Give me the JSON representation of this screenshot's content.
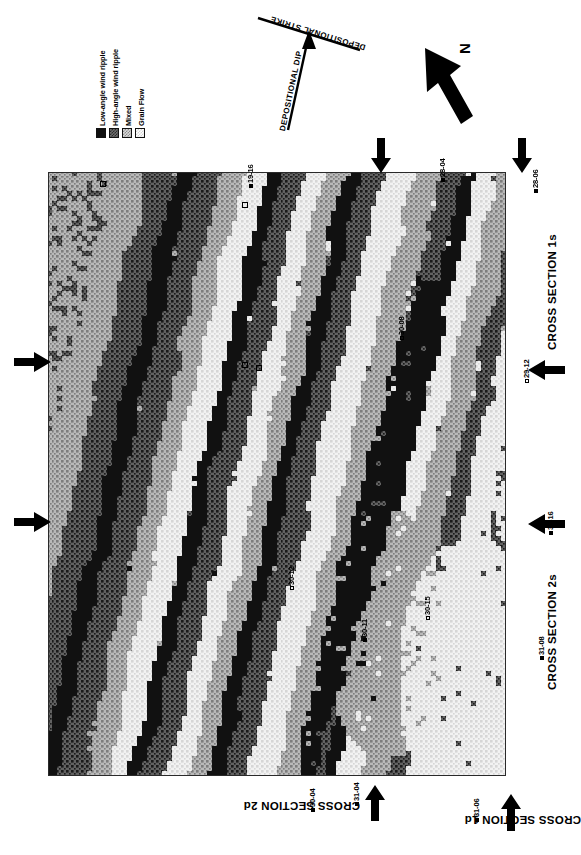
{
  "figure": {
    "kind": "geological-facies-map",
    "title_present": false
  },
  "legend": {
    "name": "facies-legend",
    "items": [
      {
        "label": "Low-angle wind ripple",
        "swatch": "solid-black",
        "color": "#101010"
      },
      {
        "label": "High-angle wind ripple",
        "swatch": "dark-checker",
        "color": "#4c4c4c"
      },
      {
        "label": "Mixed",
        "swatch": "mid-checker",
        "color": "#a8a8a8"
      },
      {
        "label": "Grain Flow",
        "swatch": "light-checker",
        "color": "#e8e8e8"
      }
    ]
  },
  "orientation": {
    "strike_label": "DEPOSITIONAL STRIKE",
    "dip_label": "DEPOSITIONAL DIP",
    "north_label": "N"
  },
  "sections": [
    {
      "id": "cross-section-1s",
      "label": "CROSS SECTION 1s",
      "side": "right"
    },
    {
      "id": "cross-section-2s",
      "label": "CROSS SECTION 2s",
      "side": "right"
    },
    {
      "id": "cross-section-2d",
      "label": "CROSS SECTION 2d",
      "side": "bottom"
    },
    {
      "id": "cross-section-1d",
      "label": "CROSS SECTION 1d",
      "side": "bottom"
    }
  ],
  "wells": [
    {
      "id": "19-16",
      "label": "19-16",
      "x": 246,
      "y": 188
    },
    {
      "id": "28-04",
      "label": "28-04",
      "x": 438,
      "y": 182
    },
    {
      "id": "28-06",
      "label": "28-06",
      "x": 531,
      "y": 193
    },
    {
      "id": "30-08",
      "label": "30-08",
      "x": 397,
      "y": 340
    },
    {
      "id": "29-12",
      "label": "29-12",
      "x": 522,
      "y": 383
    },
    {
      "id": "30-16",
      "label": "30-16",
      "x": 546,
      "y": 535
    },
    {
      "id": "30-12",
      "label": "30-12",
      "x": 287,
      "y": 590
    },
    {
      "id": "30-15",
      "label": "30-15",
      "x": 423,
      "y": 620
    },
    {
      "id": "30-11",
      "label": "30-11",
      "x": 360,
      "y": 642
    },
    {
      "id": "31-08",
      "label": "31-08",
      "x": 537,
      "y": 660
    },
    {
      "id": "30-04",
      "label": "30-04",
      "x": 308,
      "y": 812
    },
    {
      "id": "31-04",
      "label": "31-04",
      "x": 352,
      "y": 806
    },
    {
      "id": "31-06",
      "label": "31-06",
      "x": 472,
      "y": 822
    }
  ],
  "arrows": [
    {
      "name": "section-arrow-top-left",
      "dir": "down",
      "x": 379,
      "y": 140
    },
    {
      "name": "section-arrow-top-right",
      "dir": "down",
      "x": 520,
      "y": 140
    },
    {
      "name": "section-arrow-left-upper",
      "dir": "right",
      "x": 20,
      "y": 360
    },
    {
      "name": "section-arrow-left-lower",
      "dir": "right",
      "x": 20,
      "y": 520
    },
    {
      "name": "section-arrow-right-2s",
      "dir": "left",
      "x": 540,
      "y": 530
    },
    {
      "name": "section-arrow-right-29",
      "dir": "left",
      "x": 540,
      "y": 375
    },
    {
      "name": "section-arrow-bottom-2d",
      "dir": "up",
      "x": 372,
      "y": 790
    },
    {
      "name": "section-arrow-bottom-1d",
      "dir": "up",
      "x": 508,
      "y": 800
    }
  ],
  "map": {
    "name": "facies-distribution-map",
    "facies_order": [
      "Low-angle wind ripple",
      "High-angle wind ripple",
      "Mixed",
      "Grain Flow"
    ],
    "grid_cols": 92,
    "grid_rows": 121,
    "description": "Pixelated map of eolian facies belts trending NNE-SSW across the field area"
  },
  "chart_data": {
    "type": "heatmap",
    "title": "",
    "xlabel": "",
    "ylabel": "",
    "categories": [
      "Low-angle wind ripple",
      "High-angle wind ripple",
      "Mixed",
      "Grain Flow"
    ],
    "values": [
      4,
      3,
      2,
      1
    ],
    "colors": [
      "#101010",
      "#4c4c4c",
      "#a8a8a8",
      "#e8e8e8"
    ],
    "grid": false,
    "legend_position": "top-left"
  }
}
